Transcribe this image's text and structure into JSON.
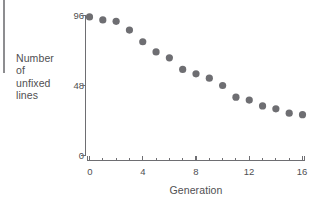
{
  "chart_data": {
    "type": "scatter",
    "title": "",
    "xlabel": "Generation",
    "ylabel": "Number of unfixed lines",
    "ylabel_lines": [
      "Number",
      "of",
      "unfixed",
      "lines"
    ],
    "x": [
      0,
      1,
      2,
      3,
      4,
      5,
      6,
      7,
      8,
      9,
      10,
      11,
      12,
      13,
      14,
      15,
      16
    ],
    "values": [
      95,
      93,
      92,
      86,
      78,
      71,
      67,
      59,
      56,
      53,
      48,
      40,
      38,
      34,
      32,
      29,
      28
    ],
    "xlim": [
      0,
      16
    ],
    "ylim": [
      0,
      96
    ],
    "xticks": [
      0,
      4,
      8,
      12,
      16
    ],
    "xticklabels": [
      "0",
      "4",
      "8",
      "12",
      "16"
    ],
    "xminorticks": [
      1,
      2,
      3,
      5,
      6,
      7,
      9,
      10,
      11,
      13,
      14,
      15
    ],
    "yticks": [
      0,
      48,
      96
    ],
    "yticklabels": [
      "0",
      "48",
      "96"
    ],
    "grid": false,
    "legend": null,
    "marker": "circle",
    "marker_color": "#6e6e72",
    "axis_color": "#6e6e72"
  },
  "figure": {
    "y_axis_title_lines": [
      "Number",
      "of",
      "unfixed",
      "lines"
    ],
    "x_axis_title": "Generation",
    "y_tick_top": "96",
    "y_tick_mid": "48",
    "y_tick_bottom": "0",
    "x_tick_0": "0",
    "x_tick_1": "4",
    "x_tick_2": "8",
    "x_tick_3": "12",
    "x_tick_4": "16"
  }
}
